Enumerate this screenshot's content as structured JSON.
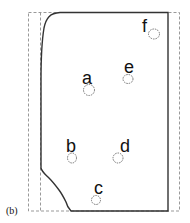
{
  "figure": {
    "caption": "(b)",
    "colors": {
      "outline": "#333333",
      "dashed": "#999999",
      "label": "#111111",
      "background": "#ffffff"
    },
    "points": [
      {
        "label": "f",
        "label_x": 145,
        "label_y": 33,
        "cx": 154,
        "cy": 34,
        "rx": 5.5,
        "ry": 5
      },
      {
        "label": "e",
        "label_x": 124,
        "label_y": 72,
        "cx": 128,
        "cy": 79,
        "rx": 5,
        "ry": 4.5
      },
      {
        "label": "a",
        "label_x": 81,
        "label_y": 83,
        "cx": 89,
        "cy": 90,
        "rx": 5.5,
        "ry": 5.5
      },
      {
        "label": "b",
        "label_x": 66,
        "label_y": 150,
        "cx": 72,
        "cy": 158,
        "rx": 4.5,
        "ry": 5
      },
      {
        "label": "d",
        "label_x": 121,
        "label_y": 151,
        "cx": 118,
        "cy": 158,
        "rx": 5,
        "ry": 5
      },
      {
        "label": "c",
        "label_x": 94,
        "label_y": 193,
        "cx": 96,
        "cy": 200,
        "rx": 4.5,
        "ry": 4.5
      }
    ]
  }
}
